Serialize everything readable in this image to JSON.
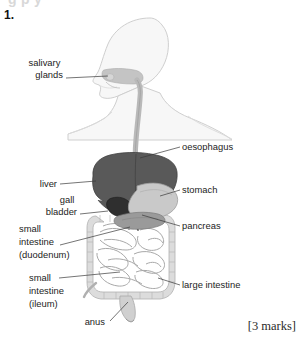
{
  "page": {
    "top_cut_text": "g  p  y",
    "question_number": "1.",
    "marks": "[3 marks]",
    "background": "#ffffff"
  },
  "diagram": {
    "name": "human-digestive-system",
    "style": "greyscale-line-drawing",
    "colors": {
      "body_outline": "#cfcfcf",
      "body_fill": "#f7f7f7",
      "liver": "#595959",
      "gall_bladder": "#2f2f2f",
      "stomach": "#c9c9c9",
      "pancreas": "#9a9a9a",
      "intestine": "#dcdcdc",
      "intestine_line": "#a8a8a8",
      "oesophagus": "#b9b9b9",
      "leader_line": "#3a3a3a",
      "label_text": "#232323"
    },
    "labels": [
      {
        "id": "salivary-glands",
        "text": "salivary\nglands",
        "lines": [
          "salivary",
          "glands"
        ],
        "side": "left",
        "text_x": 63,
        "text_y": 66,
        "leader": [
          [
            66,
            78
          ],
          [
            108,
            76
          ]
        ]
      },
      {
        "id": "oesophagus",
        "text": "oesophagus",
        "lines": [
          "oesophagus"
        ],
        "side": "right",
        "text_x": 182,
        "text_y": 150,
        "leader": [
          [
            180,
            147
          ],
          [
            140,
            158
          ]
        ]
      },
      {
        "id": "liver",
        "text": "liver",
        "lines": [
          "liver"
        ],
        "side": "left",
        "text_x": 57,
        "text_y": 187,
        "leader": [
          [
            60,
            184
          ],
          [
            96,
            181
          ]
        ]
      },
      {
        "id": "stomach",
        "text": "stomach",
        "lines": [
          "stomach"
        ],
        "side": "right",
        "text_x": 182,
        "text_y": 193,
        "leader": [
          [
            180,
            190
          ],
          [
            160,
            196
          ]
        ]
      },
      {
        "id": "gall-bladder",
        "text": "gall\nbladder",
        "lines": [
          "gall",
          "bladder"
        ],
        "side": "left",
        "text_x": 77,
        "text_y": 203,
        "leader": [
          [
            80,
            214
          ],
          [
            108,
            211
          ]
        ]
      },
      {
        "id": "pancreas",
        "text": "pancreas",
        "lines": [
          "pancreas"
        ],
        "side": "right",
        "text_x": 182,
        "text_y": 229,
        "leader": [
          [
            180,
            226
          ],
          [
            142,
            215
          ]
        ]
      },
      {
        "id": "small-intestine-duodenum",
        "text": "small\nintestine\n(duodenum)",
        "lines": [
          "small",
          "intestine",
          "(duodenum)"
        ],
        "side": "left",
        "text_x": 19,
        "text_y": 232,
        "leader": [
          [
            60,
            245
          ],
          [
            130,
            227
          ]
        ]
      },
      {
        "id": "small-intestine-ileum",
        "text": "small\nintestine\n(ileum)",
        "lines": [
          "small",
          "intestine",
          "(ileum)"
        ],
        "side": "left",
        "text_x": 29,
        "text_y": 281,
        "leader": [
          [
            59,
            278
          ],
          [
            120,
            272
          ]
        ]
      },
      {
        "id": "large-intestine",
        "text": "large intestine",
        "lines": [
          "large intestine"
        ],
        "side": "right",
        "text_x": 182,
        "text_y": 288,
        "leader": [
          [
            180,
            285
          ],
          [
            158,
            278
          ]
        ]
      },
      {
        "id": "anus",
        "text": "anus",
        "lines": [
          "anus"
        ],
        "side": "left",
        "text_x": 105,
        "text_y": 325,
        "leader": [
          [
            108,
            321
          ],
          [
            128,
            302
          ]
        ]
      }
    ],
    "organs": [
      {
        "id": "head-neck-torso-silhouette",
        "label": "body outline"
      },
      {
        "id": "mouth-cavity",
        "label": "mouth"
      },
      {
        "id": "oesophagus-tube",
        "label": "oesophagus"
      },
      {
        "id": "liver-mass",
        "label": "liver"
      },
      {
        "id": "gall-bladder-shape",
        "label": "gall bladder"
      },
      {
        "id": "stomach-shape",
        "label": "stomach"
      },
      {
        "id": "pancreas-shape",
        "label": "pancreas"
      },
      {
        "id": "large-intestine-frame",
        "label": "large intestine"
      },
      {
        "id": "small-intestine-coils",
        "label": "small intestine"
      },
      {
        "id": "rectum-anus",
        "label": "rectum and anus"
      }
    ]
  }
}
